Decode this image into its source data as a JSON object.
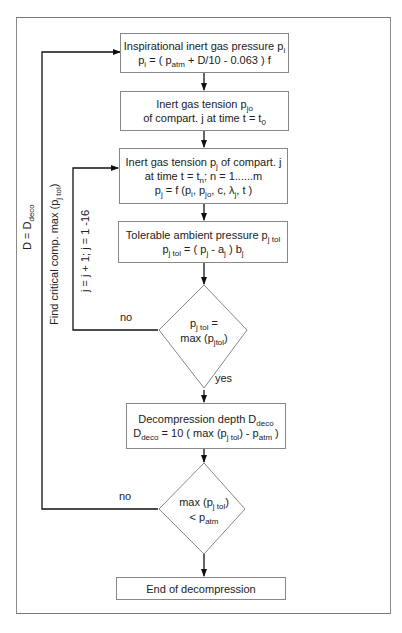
{
  "diagram": {
    "type": "flowchart",
    "nodes": {
      "inspirational": {
        "title": "Inspirational inert gas pressure p",
        "title_sub": "i",
        "formula": {
          "lhs": "p",
          "lhs_sub": "i",
          "eq_a": " = ( p",
          "eq_a_sub": "atm",
          "eq_b": " + D/10 - 0.063 ) f"
        }
      },
      "initial_tension": {
        "title": "Inert gas tension p",
        "title_sub": "jo",
        "line2": "of compart. j at time t = t",
        "line2_sub": "0"
      },
      "tension": {
        "line1": "Inert gas tension p",
        "line1_sub": "j",
        "line1_tail": " of compart. j",
        "line2": "at time t = t",
        "line2_sub": "n",
        "line2_tail": "; n = 1......m",
        "line3_a": "p",
        "line3_a_sub": "j",
        "line3_b": " = f (p",
        "line3_b_sub": "i",
        "line3_c": ", p",
        "line3_c_sub": "jo",
        "line3_d": ", c, λ",
        "line3_d_sub": "j",
        "line3_e": ", t )"
      },
      "tolerable": {
        "title": "Tolerable ambient pressure p",
        "title_sub": "j tol",
        "formula_a": "p",
        "formula_a_sub": "j tol",
        "formula_b": " = ( p",
        "formula_b_sub": "j",
        "formula_c": " - a",
        "formula_c_sub": "j",
        "formula_d": " ) b",
        "formula_d_sub": "j"
      },
      "decision_max": {
        "line1": "p",
        "line1_sub": "j tol",
        "line1_tail": " =",
        "line2": "max (p",
        "line2_sub": "jtol",
        "line2_tail": ")"
      },
      "decompression_depth": {
        "title": "Decompression depth D",
        "title_sub": "deco",
        "formula_a": "D",
        "formula_a_sub": "deco",
        "formula_b": " = 10 ( max (p",
        "formula_b_sub": "j tol",
        "formula_c": ") - p",
        "formula_c_sub": "atm",
        "formula_d": " )"
      },
      "decision_end": {
        "line1": "max (p",
        "line1_sub": "j tol",
        "line1_tail": ")",
        "line2": "< p",
        "line2_sub": "atm"
      },
      "end": {
        "label": "End of decompression"
      }
    },
    "edge_labels": {
      "no_1": "no",
      "yes": "yes",
      "no_2": "no",
      "outer_loop": "D = D",
      "outer_loop_sub": "deco",
      "find_critical": "Find critical comp. max (p",
      "find_critical_sub": "j tol",
      "find_critical_tail": ")",
      "inner_loop": "j = j + 1; j = 1 -16"
    },
    "colors": {
      "line": "#111111",
      "box_border": "#888888",
      "frame": "#8a8a8a"
    }
  }
}
